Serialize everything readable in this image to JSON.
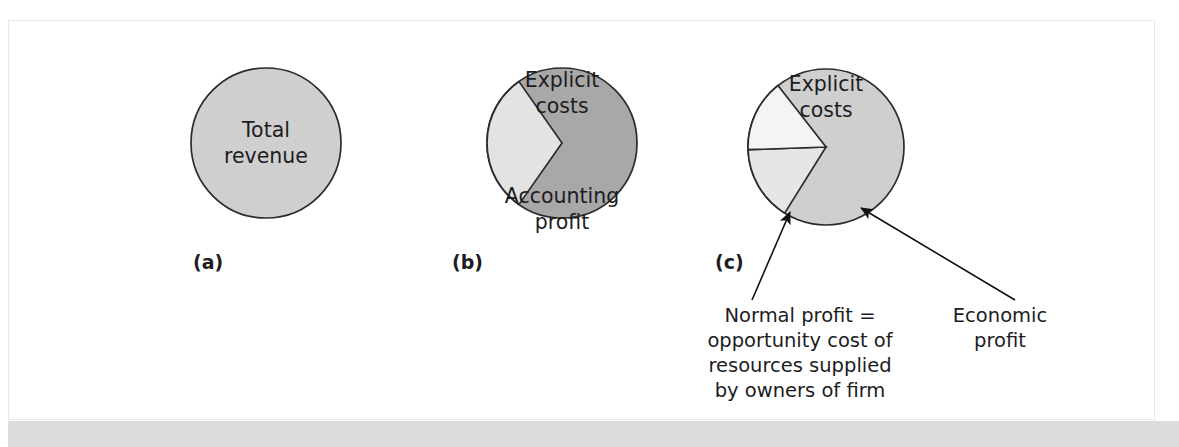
{
  "figure": {
    "panel_background": "#ffffff",
    "panel_border_color": "#e9e9ec",
    "footer_bar_color": "#dcdcde"
  },
  "colors": {
    "light_gray_fill": "#cfcfcf",
    "dark_gray_fill": "#a8a8a8",
    "pale_wedge_fill": "#e3e3e3",
    "white_wedge_fill": "#f2f2f2",
    "outline": "#2b2b2b",
    "text": "#1d1d1f"
  },
  "panels": [
    {
      "id": "a",
      "label": "(a)",
      "center": {
        "x": 266,
        "y": 143
      },
      "radius": 75,
      "body_fill": "#cfcfcf",
      "labels": [
        "Total",
        "revenue"
      ]
    },
    {
      "id": "b",
      "label": "(b)",
      "center": {
        "x": 562,
        "y": 143
      },
      "radius": 75,
      "body_fill": "#a8a8a8",
      "labels": [
        "Explicit",
        "costs"
      ],
      "wedge": {
        "fill": "#e3e3e3",
        "start_angle_deg": 215,
        "end_angle_deg": 325,
        "labels": [
          "Accounting",
          "profit"
        ]
      }
    },
    {
      "id": "c",
      "label": "(c)",
      "center": {
        "x": 826,
        "y": 147
      },
      "radius": 78,
      "body_fill": "#cfcfcf",
      "labels": [
        "Explicit",
        "costs"
      ],
      "subwedges": [
        {
          "name": "normal-profit-wedge",
          "fill": "#e6e6e6",
          "start_angle_deg": 212,
          "end_angle_deg": 268
        },
        {
          "name": "economic-profit-wedge",
          "fill": "#f4f4f4",
          "start_angle_deg": 268,
          "end_angle_deg": 322
        }
      ]
    }
  ],
  "callouts": [
    {
      "id": "normal-profit",
      "lines": [
        "Normal profit =",
        "opportunity cost of",
        "resources supplied",
        "by owners of firm"
      ],
      "text_anchor_x": 800,
      "first_line_y": 322,
      "line_height": 25,
      "arrow_from": {
        "x": 752,
        "y": 300
      },
      "arrow_to": {
        "x": 790,
        "y": 212
      }
    },
    {
      "id": "economic-profit",
      "lines": [
        "Economic",
        "profit"
      ],
      "text_anchor_x": 1000,
      "first_line_y": 322,
      "line_height": 25,
      "arrow_from": {
        "x": 1015,
        "y": 300
      },
      "arrow_to": {
        "x": 861,
        "y": 208
      }
    }
  ]
}
